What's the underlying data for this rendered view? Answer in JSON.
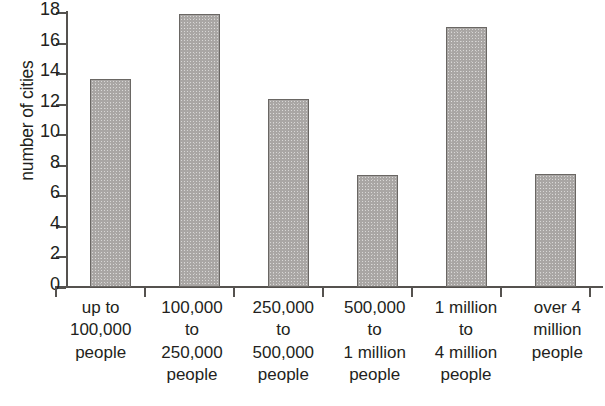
{
  "chart_data": {
    "type": "bar",
    "title": "",
    "subtitle": "",
    "xlabel": "",
    "ylabel": "number of cities",
    "ylim": [
      0,
      18
    ],
    "ytick_step": 2,
    "yticks": [
      18,
      16,
      14,
      12,
      10,
      8,
      6,
      4,
      2,
      0
    ],
    "grid": false,
    "legend": false,
    "categories": [
      "up to 100,000 people",
      "100,000 to 250,000 people",
      "250,000 to 500,000 people",
      "500,000 to 1 million people",
      "1 million to 4 million people",
      "over 4 million people"
    ],
    "category_label_lines": [
      [
        "up to",
        "100,000",
        "people"
      ],
      [
        "100,000",
        "to",
        "250,000",
        "people"
      ],
      [
        "250,000",
        "to",
        "500,000",
        "people"
      ],
      [
        "500,000",
        "to",
        "1 million",
        "people"
      ],
      [
        "1 million",
        "to",
        "4 million",
        "people"
      ],
      [
        "over 4",
        "million",
        "people"
      ]
    ],
    "values": [
      13.6,
      17.9,
      12.3,
      7.3,
      17.0,
      7.4
    ],
    "bar_color": "#a9a6a4",
    "bar_border_color": "#6a6764",
    "axis_color": "#55524f",
    "text_color": "#231f20",
    "background_color": "#ffffff"
  }
}
